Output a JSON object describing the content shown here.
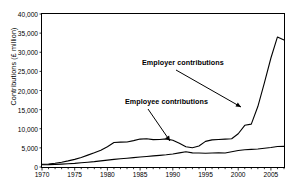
{
  "chart_data": {
    "type": "line",
    "title": "",
    "xlabel": "",
    "ylabel": "Contributions (£ million)",
    "xlim": [
      1970,
      2007
    ],
    "ylim": [
      0,
      40000
    ],
    "grid": false,
    "legend_position": "none",
    "ytick_labels": [
      "0",
      "5,000",
      "10,000",
      "15,000",
      "20,000",
      "25,000",
      "30,000",
      "35,000",
      "40,000"
    ],
    "ytick_values": [
      0,
      5000,
      10000,
      15000,
      20000,
      25000,
      30000,
      35000,
      40000
    ],
    "xtick_labels": [
      "1970",
      "1975",
      "1980",
      "1985",
      "1990",
      "1995",
      "2000",
      "2005"
    ],
    "xtick_values": [
      1970,
      1975,
      1980,
      1985,
      1990,
      1995,
      2000,
      2005
    ],
    "x": [
      1970,
      1971,
      1972,
      1973,
      1974,
      1975,
      1976,
      1977,
      1978,
      1979,
      1980,
      1981,
      1982,
      1983,
      1984,
      1985,
      1986,
      1987,
      1988,
      1989,
      1990,
      1991,
      1992,
      1993,
      1994,
      1995,
      1996,
      1997,
      1998,
      1999,
      2000,
      2001,
      2002,
      2003,
      2004,
      2005,
      2006,
      2007
    ],
    "series": [
      {
        "name": "Employer contributions",
        "color": "#000000",
        "values": [
          700,
          800,
          1000,
          1250,
          1600,
          2000,
          2500,
          3100,
          3700,
          4400,
          5300,
          6400,
          6500,
          6550,
          6900,
          7300,
          7400,
          7150,
          7200,
          7350,
          7000,
          6200,
          5300,
          5050,
          5500,
          6700,
          7100,
          7200,
          7300,
          7400,
          8700,
          10900,
          11200,
          15800,
          22000,
          28500,
          34000,
          33200
        ]
      },
      {
        "name": "Employee contributions",
        "color": "#000000",
        "values": [
          600,
          620,
          680,
          760,
          850,
          950,
          1100,
          1250,
          1400,
          1600,
          1800,
          2000,
          2150,
          2300,
          2450,
          2600,
          2750,
          2900,
          3050,
          3200,
          3400,
          3700,
          4000,
          3700,
          3650,
          3600,
          3650,
          3700,
          3650,
          4000,
          4300,
          4500,
          4600,
          4700,
          4900,
          5100,
          5350,
          5400
        ]
      }
    ],
    "annotations": [
      {
        "text": "Employer contributions",
        "label_x": 142,
        "label_y": 58,
        "arrow_from_x": 176,
        "arrow_from_y": 70,
        "arrow_to_x": 241,
        "arrow_to_y": 107
      },
      {
        "text": "Employee contributions",
        "label_x": 125,
        "label_y": 97,
        "arrow_from_x": 148,
        "arrow_from_y": 109,
        "arrow_to_x": 170,
        "arrow_to_y": 141
      }
    ]
  }
}
